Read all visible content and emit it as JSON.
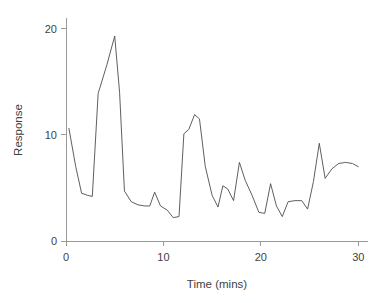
{
  "chart_data": {
    "type": "line",
    "title": "",
    "xlabel": "Time (mins)",
    "ylabel": "Response",
    "xlim": [
      0,
      31
    ],
    "ylim": [
      0,
      21
    ],
    "xticks": [
      0,
      10,
      20,
      30
    ],
    "yticks": [
      0,
      10,
      20
    ],
    "xtick_labels": [
      "0",
      "10",
      "20",
      "30"
    ],
    "ytick_labels": [
      "0",
      "10",
      "20"
    ],
    "grid": false,
    "legend": null,
    "series": [
      {
        "name": "Response",
        "color": "#4d4d4d",
        "x": [
          0.3,
          1.0,
          1.6,
          2.2,
          2.7,
          3.3,
          4.2,
          5.0,
          5.5,
          6.0,
          6.7,
          7.4,
          8.1,
          8.6,
          9.1,
          9.7,
          10.4,
          11.0,
          11.6,
          12.1,
          12.6,
          13.2,
          13.7,
          14.3,
          15.0,
          15.6,
          16.1,
          16.6,
          17.2,
          17.8,
          18.4,
          19.1,
          19.8,
          20.4,
          21.0,
          21.6,
          22.2,
          22.8,
          23.5,
          24.2,
          24.8,
          25.4,
          26.0,
          26.6,
          27.3,
          28.0,
          28.7,
          29.4,
          30.0
        ],
        "y": [
          10.6,
          7.0,
          4.5,
          4.3,
          4.2,
          13.9,
          16.6,
          19.3,
          14.0,
          4.7,
          3.7,
          3.4,
          3.3,
          3.3,
          4.6,
          3.3,
          2.9,
          2.2,
          2.3,
          10.1,
          10.5,
          11.9,
          11.5,
          7.0,
          4.3,
          3.2,
          5.2,
          4.9,
          3.8,
          7.4,
          5.7,
          4.3,
          2.7,
          2.6,
          5.4,
          3.3,
          2.3,
          3.7,
          3.8,
          3.8,
          3.0,
          5.6,
          9.2,
          5.9,
          6.8,
          7.3,
          7.4,
          7.3,
          7.0
        ]
      }
    ]
  },
  "figure": {
    "background_color": "#ffffff",
    "axis_color": "#9a9a9a",
    "text_color": "#3f3f3f"
  }
}
